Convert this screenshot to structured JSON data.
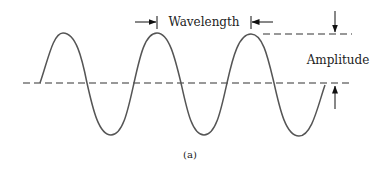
{
  "diagram": {
    "labels": {
      "wavelength": "Wavelength",
      "amplitude": "Amplitude",
      "caption": "(a)"
    },
    "colors": {
      "wave": "#555555",
      "dash": "#333333",
      "text": "#222222",
      "arrow": "#111111"
    }
  }
}
